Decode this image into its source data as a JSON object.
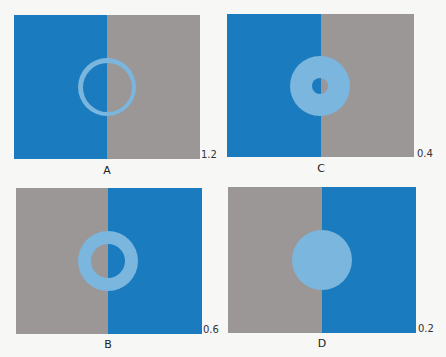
{
  "colors": {
    "blue": "#1a7bbf",
    "gray": "#9b9797",
    "ring": "#7ab6de",
    "background": "#f7f7f5"
  },
  "panels": [
    {
      "id": "A",
      "label": "A",
      "value": "1.2",
      "left_color": "blue",
      "right_color": "gray",
      "box": [
        14,
        15,
        200,
        159
      ],
      "divider_x": 107,
      "center": [
        107,
        87
      ],
      "outer_r": 29,
      "inner_r": 24.5,
      "value_pos": [
        201,
        149
      ],
      "label_pos": [
        107,
        164
      ]
    },
    {
      "id": "C",
      "label": "C",
      "value": "0.4",
      "left_color": "blue",
      "right_color": "gray",
      "box": [
        227,
        14,
        414,
        157
      ],
      "divider_x": 321,
      "center": [
        320,
        86
      ],
      "outer_r": 30,
      "inner_r": 8,
      "value_pos": [
        417,
        148
      ],
      "label_pos": [
        321,
        162
      ]
    },
    {
      "id": "B",
      "label": "B",
      "value": "0.6",
      "left_color": "gray",
      "right_color": "blue",
      "box": [
        16,
        188,
        202,
        334
      ],
      "divider_x": 108,
      "center": [
        108,
        261
      ],
      "outer_r": 30,
      "inner_r": 17,
      "value_pos": [
        203,
        324
      ],
      "label_pos": [
        108,
        338
      ]
    },
    {
      "id": "D",
      "label": "D",
      "value": "0.2",
      "left_color": "gray",
      "right_color": "blue",
      "box": [
        228,
        187,
        416,
        333
      ],
      "divider_x": 322,
      "center": [
        322,
        260
      ],
      "outer_r": 30,
      "inner_r": 0,
      "value_pos": [
        418,
        323
      ],
      "label_pos": [
        322,
        337
      ]
    }
  ]
}
